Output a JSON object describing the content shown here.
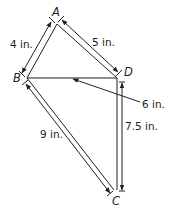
{
  "diagram": {
    "vertices": [
      {
        "label": "A",
        "x": 57,
        "y": 22
      },
      {
        "label": "B",
        "x": 27,
        "y": 78
      },
      {
        "label": "D",
        "x": 117,
        "y": 78
      },
      {
        "label": "C",
        "x": 117,
        "y": 192
      }
    ],
    "labels": {
      "A": "A",
      "B": "B",
      "C": "C",
      "D": "D"
    },
    "measurements": {
      "AB": "4 in.",
      "AD": "5 in.",
      "BD": "6 in.",
      "BC": "9 in.",
      "DC": "7.5 in."
    },
    "stroke_color": "#231f20"
  }
}
